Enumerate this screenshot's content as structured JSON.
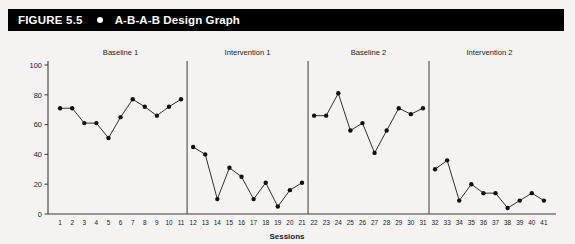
{
  "header": {
    "figure_number": "FIGURE 5.5",
    "bullet_icon": "filled-circle-icon",
    "title": "A-B-A-B Design Graph",
    "background_color": "#000000",
    "text_color": "#ffffff"
  },
  "chart_data": {
    "type": "line",
    "title": "A-B-A-B Design Graph",
    "xlabel": "Sessions",
    "ylabel": "",
    "xlim": [
      0,
      42
    ],
    "ylim": [
      0,
      100
    ],
    "yticks": [
      0,
      20,
      40,
      60,
      80,
      100
    ],
    "xticks": [
      1,
      2,
      3,
      4,
      5,
      6,
      7,
      8,
      9,
      10,
      11,
      12,
      13,
      14,
      15,
      16,
      17,
      18,
      19,
      20,
      21,
      22,
      23,
      24,
      25,
      26,
      27,
      28,
      29,
      30,
      31,
      32,
      33,
      34,
      35,
      36,
      37,
      38,
      39,
      40,
      41
    ],
    "grid": false,
    "legend": "none",
    "marker": "filled-circle",
    "line_color": "#111111",
    "phases": [
      {
        "label": "Baseline 1",
        "x": [
          1,
          2,
          3,
          4,
          5,
          6,
          7,
          8,
          9,
          10,
          11
        ],
        "values": [
          71,
          71,
          61,
          61,
          51,
          65,
          77,
          72,
          66,
          72,
          77
        ]
      },
      {
        "label": "Intervention 1",
        "x": [
          12,
          13,
          14,
          15,
          16,
          17,
          18,
          19,
          20,
          21
        ],
        "values": [
          45,
          40,
          10,
          31,
          25,
          10,
          21,
          5,
          16,
          21
        ]
      },
      {
        "label": "Baseline 2",
        "x": [
          22,
          23,
          24,
          25,
          26,
          27,
          28,
          29,
          30,
          31
        ],
        "values": [
          66,
          66,
          81,
          56,
          61,
          41,
          56,
          71,
          67,
          71
        ]
      },
      {
        "label": "Intervention 2",
        "x": [
          32,
          33,
          34,
          35,
          36,
          37,
          38,
          39,
          40,
          41
        ],
        "values": [
          30,
          36,
          9,
          20,
          14,
          14,
          4,
          9,
          14,
          9
        ]
      }
    ],
    "phase_dividers_between": [
      11.5,
      21.5,
      31.5
    ]
  }
}
